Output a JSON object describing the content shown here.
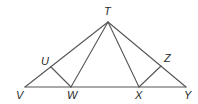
{
  "diagram": {
    "type": "geometry-figure",
    "stroke_color": "#555555",
    "label_color": "#2a2a2a",
    "points": {
      "T": {
        "label": "T",
        "x": 108,
        "y": 22,
        "lx": 104,
        "ly": 15
      },
      "U": {
        "label": "U",
        "x": 51,
        "y": 67,
        "lx": 41,
        "ly": 65
      },
      "V": {
        "label": "V",
        "x": 25,
        "y": 87,
        "lx": 16,
        "ly": 99
      },
      "W": {
        "label": "W",
        "x": 71,
        "y": 87,
        "lx": 67,
        "ly": 99
      },
      "X": {
        "label": "X",
        "x": 139,
        "y": 87,
        "lx": 135,
        "ly": 99
      },
      "Z": {
        "label": "Z",
        "x": 161,
        "y": 66,
        "lx": 164,
        "ly": 62
      },
      "Y": {
        "label": "Y",
        "x": 186,
        "y": 87,
        "lx": 184,
        "ly": 99
      }
    },
    "segments": [
      [
        "V",
        "Y"
      ],
      [
        "V",
        "T"
      ],
      [
        "T",
        "Y"
      ],
      [
        "T",
        "W"
      ],
      [
        "T",
        "X"
      ],
      [
        "U",
        "W"
      ],
      [
        "X",
        "Z"
      ]
    ]
  }
}
